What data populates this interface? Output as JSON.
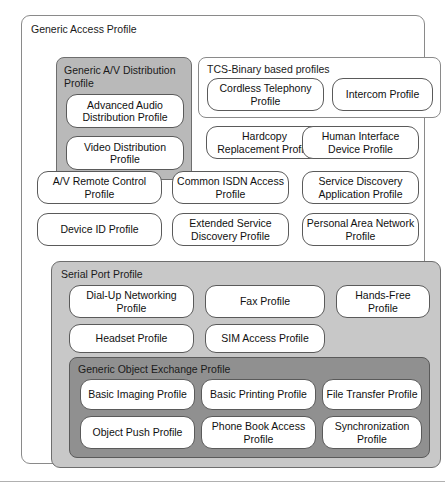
{
  "figure": {
    "colors": {
      "page_background": "#ffffff",
      "outer_frame_border": "#8a8a8a",
      "av_distribution_fill": "#b9b9b9",
      "serial_port_fill": "#c8c8c8",
      "object_exchange_fill": "#909090",
      "profile_box_fill": "#ffffff",
      "profile_box_border": "#5a5a5a",
      "text": "#101010"
    }
  },
  "generic_access_profile": {
    "label": "Generic Access Profile"
  },
  "av_distribution_group": {
    "label": "Generic A/V Distribution Profile",
    "profiles": [
      {
        "label": "Advanced Audio Distribution Profile"
      },
      {
        "label": "Video Distribution Profile"
      }
    ]
  },
  "tcs_binary_group": {
    "label": "TCS-Binary based profiles",
    "profiles": [
      {
        "label": "Cordless Telephony Profile"
      },
      {
        "label": "Intercom Profile"
      }
    ]
  },
  "standalone_profiles": [
    {
      "label": "Hardcopy Replacement Profile"
    },
    {
      "label": "Human Interface Device Profile"
    },
    {
      "label": "A/V Remote Control Profile"
    },
    {
      "label": "Common ISDN Access Profile"
    },
    {
      "label": "Service Discovery Application Profile"
    },
    {
      "label": "Device ID Profile"
    },
    {
      "label": "Extended Service Discovery Profile"
    },
    {
      "label": "Personal Area Network Profile"
    }
  ],
  "serial_port_group": {
    "label": "Serial Port Profile",
    "profiles": [
      {
        "label": "Dial-Up Networking Profile"
      },
      {
        "label": "Fax Profile"
      },
      {
        "label": "Hands-Free Profile"
      },
      {
        "label": "Headset Profile"
      },
      {
        "label": "SIM Access Profile"
      }
    ]
  },
  "object_exchange_group": {
    "label": "Generic Object Exchange Profile",
    "profiles": [
      {
        "label": "Basic Imaging Profile"
      },
      {
        "label": "Basic Printing Profile"
      },
      {
        "label": "File Transfer Profile"
      },
      {
        "label": "Object Push Profile"
      },
      {
        "label": "Phone Book Access Profile"
      },
      {
        "label": "Synchronization Profile"
      }
    ]
  }
}
